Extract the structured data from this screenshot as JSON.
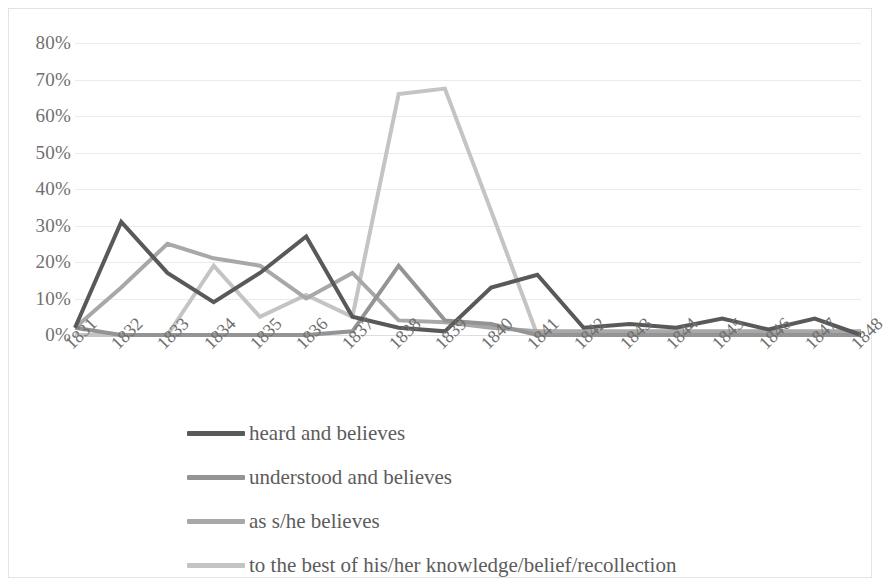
{
  "chart_data": {
    "type": "line",
    "title": "",
    "xlabel": "",
    "ylabel": "",
    "categories": [
      "1831",
      "1832",
      "1833",
      "1834",
      "1835",
      "1836",
      "1837",
      "1838",
      "1839",
      "1840",
      "1841",
      "1842",
      "1843",
      "1844",
      "1845",
      "1846",
      "1847",
      "1848"
    ],
    "ylim": [
      0,
      80
    ],
    "ytick_labels": [
      "0%",
      "10%",
      "20%",
      "30%",
      "40%",
      "50%",
      "60%",
      "70%",
      "80%"
    ],
    "ytick_values": [
      0,
      10,
      20,
      30,
      40,
      50,
      60,
      70,
      80
    ],
    "grid": true,
    "legend_position": "bottom",
    "series": [
      {
        "name": "heard and believes",
        "color": "#595959",
        "values": [
          2,
          31,
          17,
          9,
          17,
          27,
          5,
          2,
          1,
          13,
          16.5,
          2,
          3,
          2,
          4.5,
          1.5,
          4.5,
          0
        ]
      },
      {
        "name": "understood and believes",
        "color": "#949494",
        "values": [
          2,
          0,
          0,
          0,
          0,
          0,
          1,
          19,
          4,
          3,
          0,
          0,
          0,
          0,
          0,
          0,
          0,
          0
        ]
      },
      {
        "name": "as s/he believes",
        "color": "#a8a8a8",
        "values": [
          2,
          13,
          25,
          21,
          19,
          10,
          17,
          4,
          3.5,
          2,
          1,
          1,
          1,
          1,
          1,
          1,
          1,
          1
        ]
      },
      {
        "name": "to the best of his/her knowledge/belief/recollection",
        "color": "#c4c4c4",
        "values": [
          0,
          0,
          0,
          19,
          5,
          11,
          5,
          66,
          67.5,
          34,
          0,
          0,
          0,
          0,
          0,
          0,
          0,
          0
        ]
      }
    ]
  },
  "legend": {
    "items": [
      {
        "label": "heard and believes"
      },
      {
        "label": "understood and believes"
      },
      {
        "label": "as s/he believes"
      },
      {
        "label": "to the best of his/her knowledge/belief/recollection"
      }
    ]
  }
}
